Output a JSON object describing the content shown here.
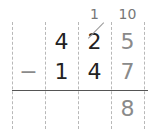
{
  "problem": {
    "operator": "−",
    "carry": {
      "tens": "1",
      "ones": "10"
    },
    "minuend": {
      "hundreds": "4",
      "tens": "2",
      "ones": "5"
    },
    "subtrahend": {
      "hundreds": "1",
      "tens": "4",
      "ones": "7"
    },
    "result": {
      "ones": "8"
    }
  }
}
